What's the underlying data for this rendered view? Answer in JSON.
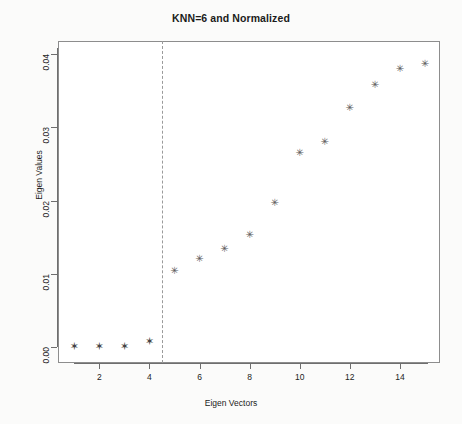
{
  "chart_data": {
    "type": "scatter",
    "title": "KNN=6 and Normalized",
    "xlabel": "Eigen Vectors",
    "ylabel": "Eigen Values",
    "x": [
      1,
      2,
      3,
      4,
      5,
      6,
      7,
      8,
      9,
      10,
      11,
      12,
      13,
      14,
      15
    ],
    "values": [
      0.0001,
      0.0001,
      0.0,
      0.0007,
      0.0105,
      0.0121,
      0.0135,
      0.0154,
      0.0197,
      0.0266,
      0.028,
      0.0327,
      0.0359,
      0.038,
      0.0387
    ],
    "series": [
      {
        "name": "Eigen Values",
        "marker": "asterisk",
        "color": "#5c5c5c",
        "values": [
          0.0001,
          0.0001,
          0.0,
          0.0007,
          0.0105,
          0.0121,
          0.0135,
          0.0154,
          0.0197,
          0.0266,
          0.028,
          0.0327,
          0.0359,
          0.038,
          0.0387
        ]
      }
    ],
    "xlim": [
      0.35,
      15.6
    ],
    "ylim": [
      -0.0022,
      0.0418
    ],
    "xticks": [
      2,
      4,
      6,
      8,
      10,
      12,
      14
    ],
    "xtick_labels": [
      "2",
      "4",
      "6",
      "8",
      "10",
      "12",
      "14"
    ],
    "yticks": [
      0.0,
      0.01,
      0.02,
      0.03,
      0.04
    ],
    "ytick_labels": [
      "0.00",
      "0.01",
      "0.02",
      "0.03",
      "0.04"
    ],
    "grid": false,
    "legend": null,
    "annotations": [
      {
        "name": "eigengap-threshold",
        "type": "vertical-dashed-line",
        "x": 4.5,
        "color": "#9a9a9a",
        "style": "dashed"
      }
    ]
  },
  "figure": {
    "background": "#fbfbfa",
    "plot_background": "#ffffff",
    "frame_color": "#8d8d8d",
    "axis_color": "#6e6e6e",
    "marker_color": "#5c5c5c",
    "title_color": "#1b1b1b"
  }
}
